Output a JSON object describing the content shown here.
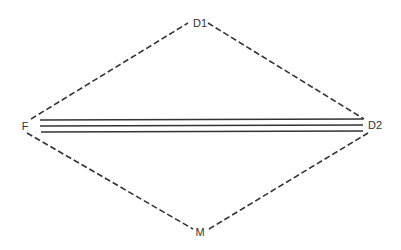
{
  "diagram": {
    "type": "relationship-diamond",
    "nodes": [
      {
        "id": "D1",
        "label": "D1",
        "x": 200,
        "y": 23
      },
      {
        "id": "F",
        "label": "F",
        "x": 25,
        "y": 130
      },
      {
        "id": "D2",
        "label": "D2",
        "x": 375,
        "y": 129
      },
      {
        "id": "M",
        "label": "M",
        "x": 200,
        "y": 236
      }
    ],
    "edges": [
      {
        "from": "F",
        "to": "D1",
        "style": "dashed"
      },
      {
        "from": "D1",
        "to": "D2",
        "style": "dashed"
      },
      {
        "from": "F",
        "to": "M",
        "style": "dashed"
      },
      {
        "from": "M",
        "to": "D2",
        "style": "dashed"
      },
      {
        "from": "F",
        "to": "D2",
        "style": "triple-solid"
      }
    ],
    "colors": {
      "line": "#333333",
      "background": "#ffffff"
    }
  }
}
